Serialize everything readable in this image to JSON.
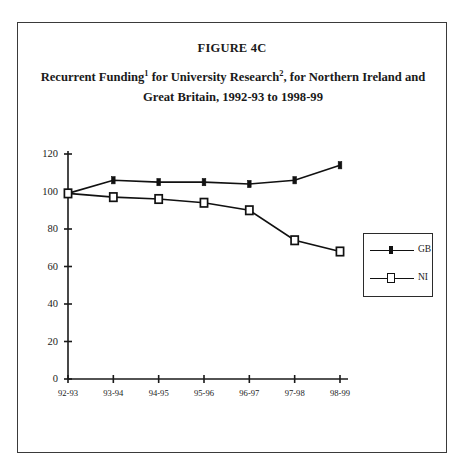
{
  "figure": {
    "label": "FIGURE 4C",
    "title_part1": "Recurrent Funding",
    "title_sup1": "1",
    "title_part2": " for University Research",
    "title_sup2": "2",
    "title_part3": ", for Northern Ireland and",
    "title_line2": "Great Britain, 1992-93 to 1998-99"
  },
  "legend": {
    "gb_label": "GB",
    "ni_label": "NI"
  },
  "chart_data": {
    "type": "line",
    "subtitle": "FIGURE 4C",
    "xlabel": "",
    "ylabel": "",
    "categories": [
      "92-93",
      "93-94",
      "94-95",
      "95-96",
      "96-97",
      "97-98",
      "98-99"
    ],
    "series": [
      {
        "name": "GB",
        "values": [
          99,
          106,
          105,
          105,
          104,
          106,
          114
        ]
      },
      {
        "name": "NI",
        "values": [
          99,
          97,
          96,
          94,
          90,
          74,
          68
        ]
      }
    ],
    "ylim": [
      0,
      120
    ],
    "yticks": [
      0,
      20,
      40,
      60,
      80,
      100,
      120
    ],
    "ytick_labels": [
      "0",
      "20",
      "40",
      "60",
      "80",
      "100",
      "120"
    ],
    "grid": false,
    "legend_position": "right",
    "colors": {
      "line": "#111111",
      "axis": "#1a1a1a"
    }
  }
}
